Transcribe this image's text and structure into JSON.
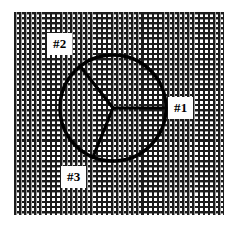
{
  "figure": {
    "background": {
      "type": "mesh-grid",
      "cell_size_px": 5,
      "line_color": "#1c1c1c",
      "fill_color": "#ffffff",
      "bounds": {
        "x": 14,
        "y": 12,
        "width": 210,
        "height": 203
      }
    },
    "circle": {
      "center_x": 113,
      "center_y": 108,
      "radius": 53,
      "stroke_color": "#000000",
      "stroke_width": 3.2,
      "fill": "none"
    },
    "spokes": [
      {
        "name": "spoke-right",
        "angle_deg": 0,
        "end_x": 166,
        "end_y": 108
      },
      {
        "name": "spoke-upper-left",
        "angle_deg": 128,
        "end_x": 80,
        "end_y": 66
      },
      {
        "name": "spoke-lower-left",
        "angle_deg": 248,
        "end_x": 93,
        "end_y": 157
      }
    ],
    "labels": [
      {
        "id": "label-1",
        "text": "#1",
        "x": 168,
        "y": 97,
        "sector": "right sector"
      },
      {
        "id": "label-2",
        "text": "#2",
        "x": 47,
        "y": 33,
        "sector": "upper-left sector"
      },
      {
        "id": "label-3",
        "text": "#3",
        "x": 61,
        "y": 166,
        "sector": "lower sector"
      }
    ],
    "colors": {
      "line": "#000000",
      "mesh": "#1c1c1c",
      "background": "#ffffff",
      "label_background": "#fdfdfd"
    }
  }
}
